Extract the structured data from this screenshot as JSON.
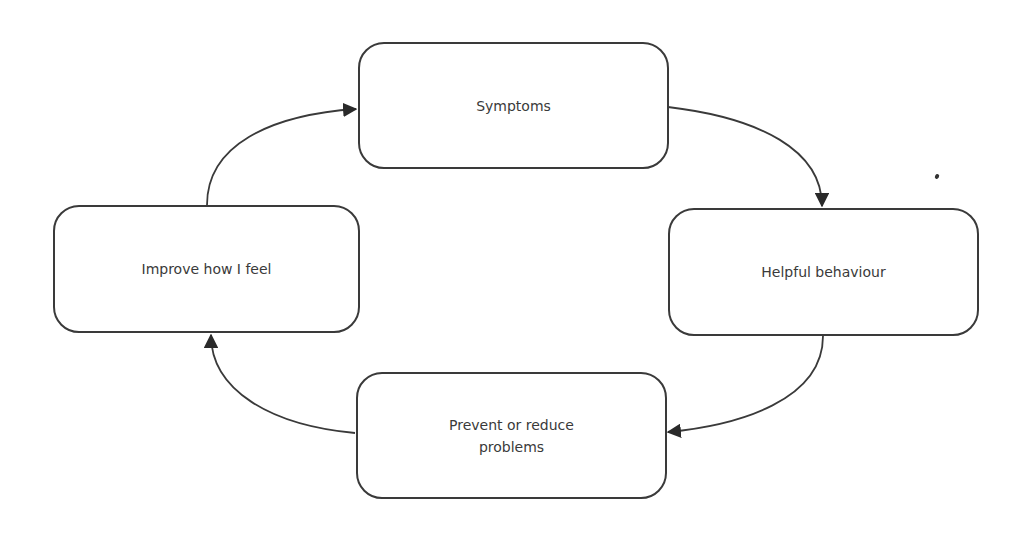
{
  "diagram": {
    "type": "cycle",
    "nodes": [
      {
        "id": "symptoms",
        "label": "Symptoms"
      },
      {
        "id": "helpful-behaviour",
        "label": "Helpful behaviour"
      },
      {
        "id": "prevent-reduce",
        "label": "Prevent or reduce problems"
      },
      {
        "id": "improve-feel",
        "label": "Improve how I feel"
      }
    ],
    "edges": [
      {
        "from": "symptoms",
        "to": "helpful-behaviour"
      },
      {
        "from": "helpful-behaviour",
        "to": "prevent-reduce"
      },
      {
        "from": "prevent-reduce",
        "to": "improve-feel"
      },
      {
        "from": "improve-feel",
        "to": "symptoms"
      }
    ],
    "colors": {
      "stroke": "#3a3a3a",
      "text": "#3a3a3a",
      "background": "#ffffff"
    }
  }
}
